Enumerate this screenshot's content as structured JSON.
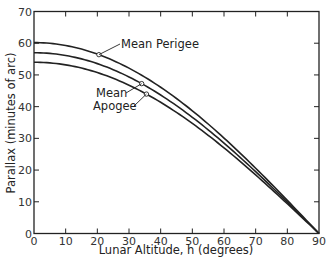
{
  "chart_data": {
    "type": "line",
    "title": "",
    "xlabel": "Lunar Altitude, h (degrees)",
    "ylabel": "Parallax (minutes of arc)",
    "xlim": [
      0,
      90
    ],
    "ylim": [
      0,
      70
    ],
    "x_ticks": [
      0,
      10,
      20,
      30,
      40,
      50,
      60,
      70,
      80,
      90
    ],
    "y_ticks": [
      0,
      10,
      20,
      30,
      40,
      50,
      60,
      70
    ],
    "grid": false,
    "legend": "none (inline annotations)",
    "x": [
      0,
      10,
      20,
      30,
      40,
      50,
      60,
      70,
      80,
      90
    ],
    "series": [
      {
        "name": "Mean Perigee",
        "values": [
          60.2,
          59.3,
          56.6,
          52.1,
          46.1,
          38.7,
          30.1,
          20.6,
          10.5,
          0
        ]
      },
      {
        "name": "Mean",
        "values": [
          57.0,
          56.1,
          53.6,
          49.4,
          43.7,
          36.6,
          28.5,
          19.5,
          9.9,
          0
        ]
      },
      {
        "name": "Apogee",
        "values": [
          54.0,
          53.2,
          50.7,
          46.8,
          41.4,
          34.7,
          27.0,
          18.5,
          9.4,
          0
        ]
      }
    ],
    "annotations": [
      {
        "text": "Mean Perigee",
        "points_to": "Mean Perigee",
        "at_x": 20
      },
      {
        "text": "Mean",
        "points_to": "Mean",
        "at_x": 34
      },
      {
        "text": "Apogee",
        "points_to": "Apogee",
        "at_x": 36
      }
    ]
  },
  "labels": {
    "xlabel": "Lunar Altitude, h (degrees)",
    "ylabel": "Parallax (minutes of arc)",
    "ann_perigee": "Mean Perigee",
    "ann_mean": "Mean",
    "ann_apogee": "Apogee"
  }
}
